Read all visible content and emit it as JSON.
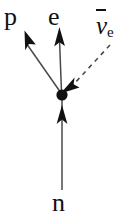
{
  "figure": {
    "background_color": "#ffffff",
    "line_color": "#4a4a4a",
    "ink_color": "#111111",
    "width": 133,
    "height": 218
  },
  "labels": {
    "proton": "p",
    "electron": "e",
    "neutron": "n",
    "antineutrino_symbol": "ν",
    "antineutrino_subscript": "e"
  },
  "particles": [
    {
      "name": "proton",
      "label": "p",
      "line_style": "solid",
      "arrow_direction": "up-left",
      "from": [
        62,
        95
      ],
      "to": [
        25,
        42
      ]
    },
    {
      "name": "electron",
      "label": "e",
      "line_style": "solid",
      "arrow_direction": "up",
      "from": [
        62,
        95
      ],
      "to": [
        59,
        38
      ]
    },
    {
      "name": "electron-antineutrino",
      "label": "ν̄e",
      "line_style": "dashed",
      "arrow_direction": "down-left",
      "from": [
        110,
        45
      ],
      "to": [
        62,
        95
      ]
    },
    {
      "name": "neutron",
      "label": "n",
      "line_style": "solid",
      "arrow_direction": "up",
      "from": [
        62,
        190
      ],
      "to": [
        62,
        95
      ]
    }
  ],
  "vertex": {
    "name": "interaction-vertex",
    "x": 62,
    "y": 95,
    "radius": 5.5,
    "color": "#111111"
  }
}
